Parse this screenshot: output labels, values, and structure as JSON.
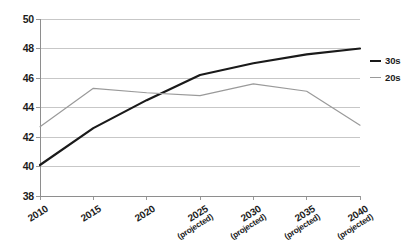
{
  "chart_data": {
    "type": "line",
    "title": "",
    "xlabel": "",
    "ylabel": "",
    "ylim": [
      38,
      50
    ],
    "ytick_values": [
      50,
      48,
      46,
      44,
      42,
      40,
      38
    ],
    "ytick_labels": [
      "50",
      "48",
      "46",
      "44",
      "42",
      "40",
      "38"
    ],
    "grid": true,
    "grid_axis": "y",
    "legend_position": "right",
    "categories": [
      "2010",
      "2015",
      "2020",
      "2025",
      "2030",
      "2035",
      "2040"
    ],
    "category_notes": [
      "",
      "",
      "",
      "(projected)",
      "(projected)",
      "(projected)",
      "(projected)"
    ],
    "series": [
      {
        "name": "30s",
        "color": "#1a1a1a",
        "line_width": 2.2,
        "values": [
          40.1,
          42.6,
          44.5,
          46.2,
          47.0,
          47.6,
          48.0
        ]
      },
      {
        "name": "20s",
        "color": "#9a9a9a",
        "line_width": 1.2,
        "values": [
          42.7,
          45.3,
          45.0,
          44.8,
          45.6,
          45.1,
          42.8
        ]
      }
    ]
  },
  "axes": {
    "gridline_color": "#b9b9b9",
    "axis_line_color": "#8e8e8e",
    "background": "#ffffff"
  },
  "legend": {
    "entries": [
      {
        "label": "30s",
        "color": "#1a1a1a"
      },
      {
        "label": "20s",
        "color": "#9a9a9a"
      }
    ]
  }
}
